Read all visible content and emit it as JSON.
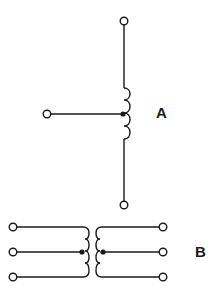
{
  "diagrams": [
    {
      "id": "A",
      "label": "A",
      "description": "Tapped inductor / autotransformer with center tap"
    },
    {
      "id": "B",
      "label": "B",
      "description": "Transformer with center-tapped primary and secondary windings"
    }
  ],
  "colors": {
    "line": "#1a1a1a",
    "background": "#ffffff"
  }
}
